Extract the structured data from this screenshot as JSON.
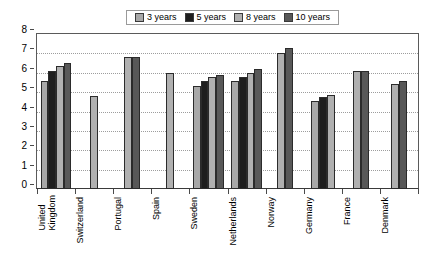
{
  "chart_data": {
    "type": "bar",
    "title": "",
    "xlabel": "",
    "ylabel": "",
    "ylim": [
      0,
      8
    ],
    "yticks": [
      "0",
      "1",
      "2",
      "3",
      "4",
      "5",
      "6",
      "7",
      "8"
    ],
    "grid": true,
    "legend_position": "top",
    "categories": [
      "United Kingdom",
      "Switzerland",
      "Portugal",
      "Spain",
      "Sweden",
      "Netherlands",
      "Norway",
      "Germany",
      "France",
      "Denmark"
    ],
    "series": [
      {
        "name": "3 years",
        "color": "#a8a8a8",
        "values": [
          5.6,
          null,
          null,
          null,
          5.3,
          5.6,
          null,
          4.55,
          null,
          null
        ]
      },
      {
        "name": "5 years",
        "color": "#1e1e1e",
        "values": [
          6.1,
          null,
          null,
          null,
          5.6,
          5.8,
          null,
          4.75,
          null,
          null
        ]
      },
      {
        "name": "8 years",
        "color": "#b0b0b0",
        "values": [
          6.35,
          4.8,
          6.8,
          6.0,
          5.8,
          6.0,
          7.0,
          4.85,
          6.1,
          5.4
        ]
      },
      {
        "name": "10 years",
        "color": "#585858",
        "values": [
          6.5,
          null,
          6.8,
          null,
          5.9,
          6.2,
          7.3,
          null,
          6.1,
          5.6
        ]
      }
    ]
  },
  "legend": {
    "items": [
      {
        "label": "3 years",
        "swatch": "#a8a8a8"
      },
      {
        "label": "5 years",
        "swatch": "#1e1e1e"
      },
      {
        "label": "8 years",
        "swatch": "#b0b0b0"
      },
      {
        "label": "10 years",
        "swatch": "#585858"
      }
    ]
  }
}
